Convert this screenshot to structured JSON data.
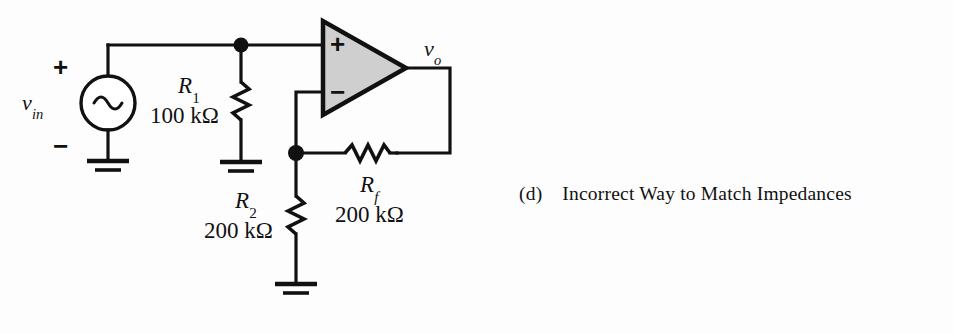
{
  "figure": {
    "kind": "circuit-schematic",
    "caption": {
      "marker": "(d)",
      "text": "Incorrect Way to Match Impedances"
    },
    "colors": {
      "ink": "#111111",
      "background": "#fdfdfd",
      "opamp_fill": "#cfcfcf"
    }
  },
  "source": {
    "name": "v_in",
    "label_base": "v",
    "label_sub": "in",
    "type": "ac-sine-source",
    "plus_sign": "+",
    "minus_sign": "−"
  },
  "opamp": {
    "name": "operational-amplifier",
    "noninverting_sign": "+",
    "inverting_sign": "−",
    "output_label_base": "v",
    "output_label_sub": "o"
  },
  "components": [
    {
      "id": "R1",
      "label_base": "R",
      "label_sub": "1",
      "value": "100 kΩ",
      "orientation": "vertical"
    },
    {
      "id": "R2",
      "label_base": "R",
      "label_sub": "2",
      "value": "200 kΩ",
      "orientation": "vertical"
    },
    {
      "id": "Rf",
      "label_base": "R",
      "label_sub": "f",
      "value": "200 kΩ",
      "orientation": "horizontal"
    }
  ],
  "grounds": [
    {
      "id": "gnd-source"
    },
    {
      "id": "gnd-r1"
    },
    {
      "id": "gnd-r2"
    }
  ]
}
